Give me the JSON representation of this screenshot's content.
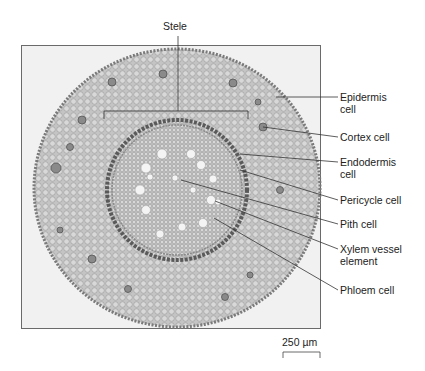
{
  "figure": {
    "top_label": "Stele",
    "labels": [
      {
        "id": "epidermis",
        "text": "Epidermis\ncell",
        "top": 91
      },
      {
        "id": "cortex",
        "text": "Cortex cell",
        "top": 131
      },
      {
        "id": "endodermis",
        "text": "Endodermis\ncell",
        "top": 156
      },
      {
        "id": "pericycle",
        "text": "Pericycle cell",
        "top": 194
      },
      {
        "id": "pith",
        "text": "Pith cell",
        "top": 218
      },
      {
        "id": "xylem",
        "text": "Xylem vessel\nelement",
        "top": 243
      },
      {
        "id": "phloem",
        "text": "Phloem cell",
        "top": 284
      }
    ],
    "scale_bar": {
      "text": "250 µm"
    }
  },
  "colors": {
    "background": "#ffffff",
    "frame_bg": "#f1f1f1",
    "frame_border": "#6a6a6a",
    "tissue_outer": "#bdbdbd",
    "tissue_ring": "#5a5a5a",
    "stele_fill": "#cfcfcf",
    "leader_line": "#333333"
  }
}
